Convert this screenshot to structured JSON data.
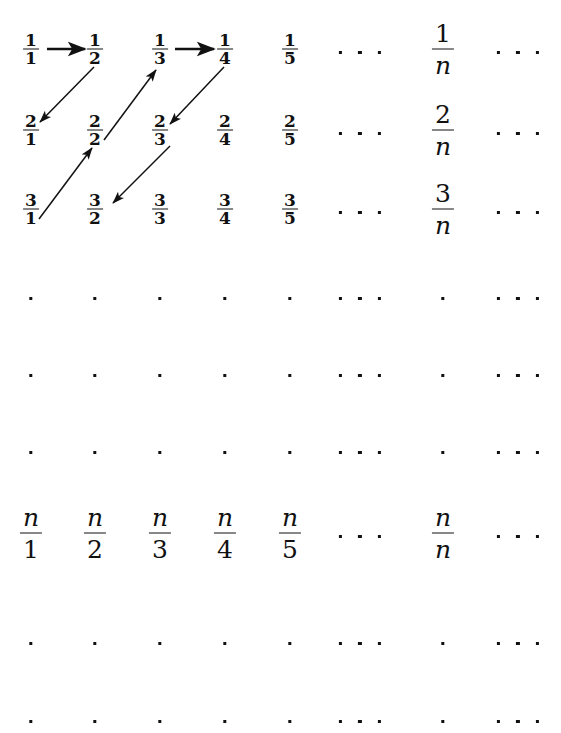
{
  "figure": {
    "width": 561,
    "height": 733,
    "background": "#ffffff",
    "ink": "#111111"
  },
  "grid": {
    "column_centers_px": [
      31,
      95,
      160,
      225,
      290,
      360,
      443,
      518
    ],
    "row_centers_px": [
      49,
      130,
      209,
      295,
      372,
      449,
      533,
      640,
      718
    ],
    "column_labels": [
      "1",
      "2",
      "3",
      "4",
      "5",
      "ellipsis",
      "n",
      "ellipsis"
    ],
    "row_labels": [
      "1",
      "2",
      "3",
      "dots",
      "dots",
      "dots",
      "n",
      "dots",
      "dots"
    ]
  },
  "rows": [
    {
      "id": "row-1",
      "y": 49,
      "kind": "fractions",
      "cells": [
        {
          "type": "frac",
          "size": "small",
          "num": "1",
          "den": "1",
          "name": "fraction-1-over-1"
        },
        {
          "type": "frac",
          "size": "small",
          "num": "1",
          "den": "2",
          "name": "fraction-1-over-2"
        },
        {
          "type": "frac",
          "size": "small",
          "num": "1",
          "den": "3",
          "name": "fraction-1-over-3"
        },
        {
          "type": "frac",
          "size": "small",
          "num": "1",
          "den": "4",
          "name": "fraction-1-over-4"
        },
        {
          "type": "frac",
          "size": "small",
          "num": "1",
          "den": "5",
          "name": "fraction-1-over-5"
        },
        {
          "type": "ellipsis",
          "name": "row-1-ellipsis"
        },
        {
          "type": "frac",
          "size": "big",
          "num": "1",
          "den": "n",
          "den_italic": true,
          "name": "fraction-1-over-n"
        },
        {
          "type": "ellipsis",
          "name": "row-1-trailing-ellipsis"
        }
      ]
    },
    {
      "id": "row-2",
      "y": 130,
      "kind": "fractions",
      "cells": [
        {
          "type": "frac",
          "size": "small",
          "num": "2",
          "den": "1",
          "name": "fraction-2-over-1"
        },
        {
          "type": "frac",
          "size": "small",
          "num": "2",
          "den": "2",
          "name": "fraction-2-over-2"
        },
        {
          "type": "frac",
          "size": "small",
          "num": "2",
          "den": "3",
          "name": "fraction-2-over-3"
        },
        {
          "type": "frac",
          "size": "small",
          "num": "2",
          "den": "4",
          "name": "fraction-2-over-4"
        },
        {
          "type": "frac",
          "size": "small",
          "num": "2",
          "den": "5",
          "name": "fraction-2-over-5"
        },
        {
          "type": "ellipsis",
          "name": "row-2-ellipsis"
        },
        {
          "type": "frac",
          "size": "big",
          "num": "2",
          "den": "n",
          "den_italic": true,
          "name": "fraction-2-over-n"
        },
        {
          "type": "ellipsis",
          "name": "row-2-trailing-ellipsis"
        }
      ]
    },
    {
      "id": "row-3",
      "y": 209,
      "kind": "fractions",
      "cells": [
        {
          "type": "frac",
          "size": "small",
          "num": "3",
          "den": "1",
          "name": "fraction-3-over-1"
        },
        {
          "type": "frac",
          "size": "small",
          "num": "3",
          "den": "2",
          "name": "fraction-3-over-2"
        },
        {
          "type": "frac",
          "size": "small",
          "num": "3",
          "den": "3",
          "name": "fraction-3-over-3"
        },
        {
          "type": "frac",
          "size": "small",
          "num": "3",
          "den": "4",
          "name": "fraction-3-over-4"
        },
        {
          "type": "frac",
          "size": "small",
          "num": "3",
          "den": "5",
          "name": "fraction-3-over-5"
        },
        {
          "type": "ellipsis",
          "name": "row-3-ellipsis"
        },
        {
          "type": "frac",
          "size": "big",
          "num": "3",
          "den": "n",
          "den_italic": true,
          "name": "fraction-3-over-n"
        },
        {
          "type": "ellipsis",
          "name": "row-3-trailing-ellipsis"
        }
      ]
    },
    {
      "id": "row-dots-1",
      "y": 295,
      "kind": "dots",
      "cells": [
        {
          "type": "dot",
          "name": "vertical-dot"
        },
        {
          "type": "dot",
          "name": "vertical-dot"
        },
        {
          "type": "dot",
          "name": "vertical-dot"
        },
        {
          "type": "dot",
          "name": "vertical-dot"
        },
        {
          "type": "dot",
          "name": "vertical-dot"
        },
        {
          "type": "dots3",
          "name": "diagonal-dots"
        },
        {
          "type": "dot",
          "name": "vertical-dot"
        },
        {
          "type": "dots3",
          "name": "diagonal-dots"
        }
      ]
    },
    {
      "id": "row-dots-2",
      "y": 372,
      "kind": "dots",
      "cells": [
        {
          "type": "dot",
          "name": "vertical-dot"
        },
        {
          "type": "dot",
          "name": "vertical-dot"
        },
        {
          "type": "dot",
          "name": "vertical-dot"
        },
        {
          "type": "dot",
          "name": "vertical-dot"
        },
        {
          "type": "dot",
          "name": "vertical-dot"
        },
        {
          "type": "dots3",
          "name": "diagonal-dots"
        },
        {
          "type": "dot",
          "name": "vertical-dot"
        },
        {
          "type": "dots3",
          "name": "diagonal-dots"
        }
      ]
    },
    {
      "id": "row-dots-3",
      "y": 449,
      "kind": "dots",
      "cells": [
        {
          "type": "dot",
          "name": "vertical-dot"
        },
        {
          "type": "dot",
          "name": "vertical-dot"
        },
        {
          "type": "dot",
          "name": "vertical-dot"
        },
        {
          "type": "dot",
          "name": "vertical-dot"
        },
        {
          "type": "dot",
          "name": "vertical-dot"
        },
        {
          "type": "dots3",
          "name": "diagonal-dots"
        },
        {
          "type": "dot",
          "name": "vertical-dot"
        },
        {
          "type": "dots3",
          "name": "diagonal-dots"
        }
      ]
    },
    {
      "id": "row-n",
      "y": 533,
      "kind": "fractions",
      "cells": [
        {
          "type": "frac",
          "size": "big",
          "num": "n",
          "den": "1",
          "num_italic": true,
          "name": "fraction-n-over-1"
        },
        {
          "type": "frac",
          "size": "big",
          "num": "n",
          "den": "2",
          "num_italic": true,
          "name": "fraction-n-over-2"
        },
        {
          "type": "frac",
          "size": "big",
          "num": "n",
          "den": "3",
          "num_italic": true,
          "name": "fraction-n-over-3"
        },
        {
          "type": "frac",
          "size": "big",
          "num": "n",
          "den": "4",
          "num_italic": true,
          "name": "fraction-n-over-4"
        },
        {
          "type": "frac",
          "size": "big",
          "num": "n",
          "den": "5",
          "num_italic": true,
          "name": "fraction-n-over-5"
        },
        {
          "type": "ellipsis",
          "name": "row-n-ellipsis"
        },
        {
          "type": "frac",
          "size": "big",
          "num": "n",
          "den": "n",
          "num_italic": true,
          "den_italic": true,
          "name": "fraction-n-over-n"
        },
        {
          "type": "ellipsis",
          "name": "row-n-trailing-ellipsis"
        }
      ]
    },
    {
      "id": "row-dots-4",
      "y": 640,
      "kind": "dots",
      "cells": [
        {
          "type": "dot",
          "name": "vertical-dot"
        },
        {
          "type": "dot",
          "name": "vertical-dot"
        },
        {
          "type": "dot",
          "name": "vertical-dot"
        },
        {
          "type": "dot",
          "name": "vertical-dot"
        },
        {
          "type": "dot",
          "name": "vertical-dot"
        },
        {
          "type": "dots3",
          "name": "diagonal-dots"
        },
        {
          "type": "dot",
          "name": "vertical-dot"
        },
        {
          "type": "dots3",
          "name": "diagonal-dots"
        }
      ]
    },
    {
      "id": "row-dots-5",
      "y": 718,
      "kind": "dots",
      "cells": [
        {
          "type": "dot",
          "name": "vertical-dot"
        },
        {
          "type": "dot",
          "name": "vertical-dot"
        },
        {
          "type": "dot",
          "name": "vertical-dot"
        },
        {
          "type": "dot",
          "name": "vertical-dot"
        },
        {
          "type": "dot",
          "name": "vertical-dot"
        },
        {
          "type": "dots3",
          "name": "diagonal-dots"
        },
        {
          "type": "dot",
          "name": "vertical-dot"
        },
        {
          "type": "dots3",
          "name": "diagonal-dots"
        }
      ]
    }
  ],
  "arrows": [
    {
      "name": "arrow-1-1-to-1-2",
      "from_label": "1/1",
      "to_label": "1/2",
      "direction": "right",
      "x1": 47,
      "y1": 49,
      "x2": 85,
      "y2": 49
    },
    {
      "name": "arrow-1-2-to-2-1",
      "from_label": "1/2",
      "to_label": "2/1",
      "direction": "down-left",
      "x1": 94,
      "y1": 67,
      "x2": 40,
      "y2": 122
    },
    {
      "name": "arrow-2-2-to-1-3",
      "from_label": "2/2",
      "to_label": "1/3",
      "direction": "up-right",
      "x1": 104,
      "y1": 140,
      "x2": 156,
      "y2": 70
    },
    {
      "name": "arrow-1-3-to-1-4",
      "from_label": "1/3",
      "to_label": "1/4",
      "direction": "right",
      "x1": 175,
      "y1": 49,
      "x2": 214,
      "y2": 49
    },
    {
      "name": "arrow-1-4-to-2-3",
      "from_label": "1/4",
      "to_label": "2/3",
      "direction": "down-left",
      "x1": 224,
      "y1": 67,
      "x2": 170,
      "y2": 124
    },
    {
      "name": "arrow-3-1-to-2-2",
      "from_label": "3/1",
      "to_label": "2/2",
      "direction": "up-right",
      "x1": 39,
      "y1": 219,
      "x2": 92,
      "y2": 148
    },
    {
      "name": "arrow-2-3-to-3-2",
      "from_label": "2/3",
      "to_label": "3/2",
      "direction": "down-left",
      "x1": 170,
      "y1": 146,
      "x2": 113,
      "y2": 203
    }
  ]
}
